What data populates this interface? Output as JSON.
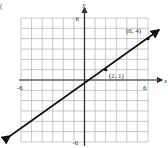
{
  "panel_label": "(",
  "chart_data": {
    "type": "line",
    "title": "",
    "xlabel": "x",
    "ylabel": "y",
    "xlim": [
      -6,
      6
    ],
    "ylim": [
      -6,
      6
    ],
    "grid": true,
    "grid_step": 1,
    "tick_labels": {
      "x": [
        "-6",
        "6"
      ],
      "y": [
        "6",
        "-6"
      ]
    },
    "series": [
      {
        "name": "line through (2, 1) and (6, 4)",
        "x": [
          -8,
          2,
          6,
          8
        ],
        "y": [
          -6.5,
          1,
          4,
          5.5
        ],
        "slope": 0.75,
        "intercept": -0.5,
        "arrows": "both"
      }
    ],
    "points": [
      {
        "x": 2,
        "y": 1,
        "label": "(2, 1)"
      },
      {
        "x": 6,
        "y": 4,
        "label": "(6, 4)"
      }
    ],
    "annotations": [
      "(6, 4)",
      "(2, 1)"
    ]
  },
  "colors": {
    "grid": "#bbbbbb",
    "axis": "#555555",
    "line": "#111111",
    "text": "#333333"
  }
}
